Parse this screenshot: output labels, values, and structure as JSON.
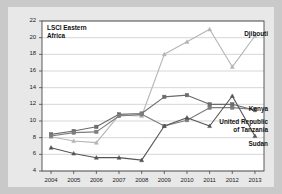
{
  "figure": {
    "background_color": "#e8e8e8",
    "outer_background_color": "#c9c9c9",
    "plot_background_color": "#ffffff",
    "border_color": "#4a4a4a"
  },
  "chart_data": {
    "type": "line",
    "title": "LSCI Eastern\nAfrica",
    "xlabel": "",
    "ylabel": "",
    "x": [
      2004,
      2005,
      2006,
      2007,
      2008,
      2009,
      2010,
      2011,
      2012,
      2013
    ],
    "xtick_labels": [
      "2004",
      "2005",
      "2006",
      "2007",
      "2008",
      "2009",
      "2010",
      "2011",
      "2012",
      "2013"
    ],
    "ytick_labels": [
      "4",
      "6",
      "8",
      "10",
      "12",
      "14",
      "16",
      "18",
      "20",
      "22"
    ],
    "yticks": [
      4,
      6,
      8,
      10,
      12,
      14,
      16,
      18,
      20,
      22
    ],
    "ylim": [
      4,
      22
    ],
    "xlim": [
      2003.6,
      2013.4
    ],
    "grid": "horizontal",
    "legend": "inline-right-labels",
    "series": [
      {
        "name": "Djibouti",
        "color": "#b5b5b5",
        "marker": "triangle",
        "label_position": "right",
        "values": [
          8.1,
          7.6,
          7.4,
          10.7,
          10.6,
          18.0,
          19.5,
          21.0,
          16.5,
          20.2
        ]
      },
      {
        "name": "Kenya",
        "color": "#6b6b6b",
        "marker": "square",
        "label_position": "right",
        "values": [
          8.4,
          8.8,
          9.3,
          10.8,
          10.9,
          12.9,
          13.1,
          12.0,
          12.0,
          11.3
        ]
      },
      {
        "name": "United Republic\nof Tanzania",
        "color": "#7d7d7d",
        "marker": "square",
        "label_position": "right",
        "values": [
          8.2,
          8.6,
          8.7,
          10.6,
          10.8,
          9.4,
          10.1,
          11.6,
          11.6,
          11.4
        ]
      },
      {
        "name": "Sudan",
        "color": "#555555",
        "marker": "triangle",
        "label_position": "right",
        "values": [
          6.8,
          6.1,
          5.6,
          5.6,
          5.3,
          9.4,
          10.4,
          9.4,
          13.0,
          8.2
        ]
      }
    ]
  }
}
